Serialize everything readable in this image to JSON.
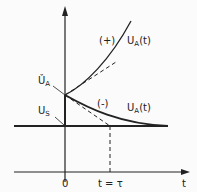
{
  "diagram": {
    "type": "time-response plot",
    "labels": {
      "plus_curve_sign": "(+)",
      "plus_curve_name": "U",
      "plus_curve_sub": "A",
      "plus_curve_arg": "(t)",
      "minus_curve_sign": "(-)",
      "minus_curve_name": "U",
      "minus_curve_sub": "A",
      "minus_curve_arg": "(t)",
      "initial_value_name": "Ǔ",
      "initial_value_sub": "A",
      "steady_value_name": "U",
      "steady_value_sub": "S",
      "origin": "0",
      "tau_mark": "t = τ",
      "x_axis": "t"
    },
    "colors": {
      "ink": "#222222",
      "background": "#fbfbfb"
    }
  }
}
